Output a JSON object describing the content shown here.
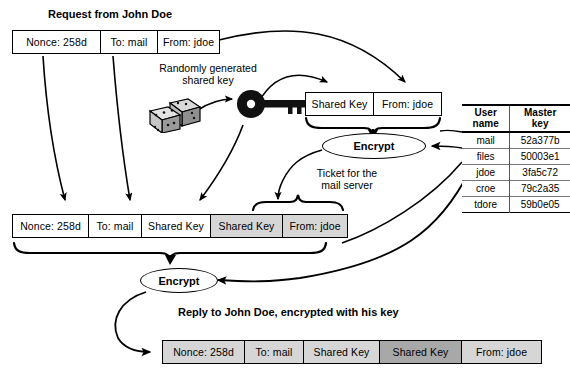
{
  "diagram": {
    "labels": {
      "request_title": "Request from John Doe",
      "random_key": "Randomly generated\nshared key",
      "random_key_line1": "Randomly generated",
      "random_key_line2": "shared key",
      "ticket_line1": "Ticket for the",
      "ticket_line2": "mail server",
      "reply_title": "Reply to John Doe, encrypted with his key",
      "encrypt_top": "Encrypt",
      "encrypt_bottom": "Encrypt"
    },
    "icons": {
      "dice": "dice-icon",
      "key": "key-icon"
    },
    "request_message": {
      "name": "request-message",
      "cells": [
        {
          "label": "Nonce: 258d",
          "shade": "sh-white",
          "width": 88
        },
        {
          "label": "To: mail",
          "shade": "sh-white",
          "width": 57
        },
        {
          "label": "From: jdoe",
          "shade": "sh-white",
          "width": 61
        }
      ]
    },
    "ticket_message": {
      "name": "ticket-payload",
      "cells": [
        {
          "label": "Shared Key",
          "shade": "sh-white",
          "width": 68
        },
        {
          "label": "From: jdoe",
          "shade": "sh-white",
          "width": 67
        }
      ]
    },
    "assembled_message": {
      "name": "assembled-reply",
      "cells": [
        {
          "label": "Nonce: 258d",
          "shade": "sh-white",
          "width": 76
        },
        {
          "label": "To: mail",
          "shade": "sh-white",
          "width": 53
        },
        {
          "label": "Shared Key",
          "shade": "sh-white",
          "width": 69
        },
        {
          "label": "Shared Key",
          "shade": "sh-light",
          "width": 72
        },
        {
          "label": "From: jdoe",
          "shade": "sh-light",
          "width": 64
        }
      ]
    },
    "encrypted_reply": {
      "name": "encrypted-reply",
      "cells": [
        {
          "label": "Nonce: 258d",
          "shade": "sh-light",
          "width": 82
        },
        {
          "label": "To: mail",
          "shade": "sh-light",
          "width": 59
        },
        {
          "label": "Shared Key",
          "shade": "sh-light",
          "width": 76
        },
        {
          "label": "Shared Key",
          "shade": "sh-dark",
          "width": 82
        },
        {
          "label": "From: jdoe",
          "shade": "sh-light",
          "width": 79
        }
      ]
    },
    "key_table": {
      "name": "master-key-table",
      "headers": [
        {
          "line1": "User",
          "line2": "name"
        },
        {
          "line1": "Master",
          "line2": "key"
        }
      ],
      "rows": [
        {
          "user": "mail",
          "key": "52a377b"
        },
        {
          "user": "files",
          "key": "50003e1"
        },
        {
          "user": "jdoe",
          "key": "3fa5c72"
        },
        {
          "user": "croe",
          "key": "79c2a35"
        },
        {
          "user": "tdore",
          "key": "59b0e05"
        }
      ]
    },
    "colors": {
      "stroke": "#000000",
      "shade_light": "#d6d6d6",
      "shade_dark": "#a8a8a8",
      "background": "#ffffff"
    }
  }
}
